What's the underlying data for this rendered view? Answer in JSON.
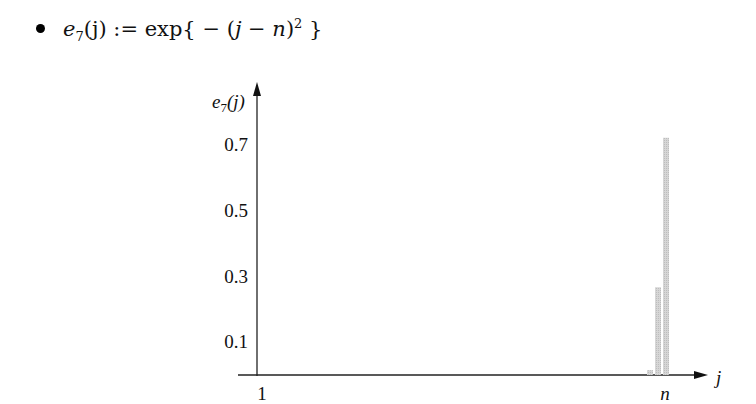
{
  "formula": {
    "lhs_name": "e",
    "lhs_sub": "7",
    "lhs_arg": "(j)",
    "assign": " := ",
    "rhs_fn": "exp{ − (",
    "rhs_var_j": "j",
    "rhs_minus": " − ",
    "rhs_var_n": "n",
    "rhs_close": ")",
    "rhs_exp": "2",
    "rhs_end": " }"
  },
  "chart_data": {
    "type": "bar",
    "xlabel": "j",
    "ylabel": "e7(j)",
    "x_tick_labels": [
      "1",
      "n"
    ],
    "y_tick_labels": [
      "0.1",
      "0.3",
      "0.5",
      "0.7"
    ],
    "y_ticks": [
      0.1,
      0.3,
      0.5,
      0.7
    ],
    "ylim": [
      0,
      0.85
    ],
    "grid": false,
    "legend": null,
    "categories": [
      "n-2",
      "n-1",
      "n"
    ],
    "values": [
      0.015,
      0.27,
      0.73
    ],
    "bar_color": "#c8c8c8",
    "note": "All bars for j far from n are ~0; only the last three indices near n are visible."
  }
}
